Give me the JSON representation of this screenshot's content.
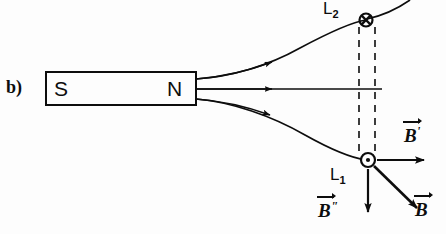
{
  "figure": {
    "part_label": "b)",
    "background_color": "#fdfdfd",
    "ink_color": "#0d0d0d",
    "width": 446,
    "height": 234
  },
  "magnet": {
    "name": "bar-magnet",
    "south_pole_label": "S",
    "north_pole_label": "N",
    "box": {
      "x": 46,
      "y": 72,
      "width": 150,
      "height": 33
    }
  },
  "field_lines": [
    {
      "id": "upper",
      "description": "curved field line from N pole rising to point L2",
      "arrow_at": "midpoint"
    },
    {
      "id": "middle",
      "description": "straight horizontal field line from N pole",
      "arrow_at": "midpoint"
    },
    {
      "id": "lower",
      "description": "curved field line from N pole descending to point L1",
      "arrow_at": "midpoint"
    }
  ],
  "points": [
    {
      "name": "point-l2",
      "label": "L",
      "subscript": "2",
      "marker": "crossed-circle-icon",
      "meaning": "field into page",
      "x": 366,
      "y": 20
    },
    {
      "name": "point-l1",
      "label": "L",
      "subscript": "1",
      "marker": "dotted-circle-icon",
      "meaning": "field out of page",
      "x": 368,
      "y": 160
    }
  ],
  "vectors": [
    {
      "name": "vector-b-prime",
      "symbol": "B",
      "prime": "'",
      "direction": "right",
      "origin": "L1"
    },
    {
      "name": "vector-b",
      "symbol": "B",
      "prime": "",
      "direction": "diagonal-down-right",
      "origin": "L1"
    },
    {
      "name": "vector-b-double-prime",
      "symbol": "B",
      "prime": "\"",
      "direction": "down",
      "origin": "L1"
    }
  ],
  "guides": {
    "name": "dashed-vertical-guides",
    "count": 2,
    "description": "two parallel dashed vertical lines linking L2 and L1"
  }
}
